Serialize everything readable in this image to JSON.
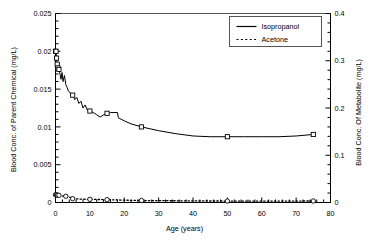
{
  "chart_data": {
    "type": "line",
    "title": "",
    "xlabel": "Age (years)",
    "ylabel": "Blood Conc. of Parent Chemical (mg/L)",
    "ylabel_right": "Blood Conc. Of Metabolite (mg/L)",
    "xlim": [
      0,
      80
    ],
    "ylim": [
      0,
      0.025
    ],
    "ylim_right": [
      0,
      0.4
    ],
    "grid": false,
    "legend_position": "top-right",
    "x_ticks": [
      0,
      10,
      20,
      30,
      40,
      50,
      60,
      70,
      80
    ],
    "x_tick_labels": [
      "0",
      "10",
      "20",
      "30",
      "40",
      "50",
      "60",
      "70",
      "80"
    ],
    "x_minor_step": 2,
    "y_ticks_left": [
      0,
      0.005,
      0.01,
      0.015,
      0.02,
      0.025
    ],
    "y_tick_labels_left": [
      "0",
      "0.005",
      "0.01",
      "0.015",
      "0.02",
      "0.025"
    ],
    "y_minor_step_left": 0.001,
    "y_ticks_right": [
      0,
      0.1,
      0.2,
      0.3,
      0.4
    ],
    "y_tick_labels_right": [
      "0",
      "0.1",
      "0.2",
      "0.3",
      "0.4"
    ],
    "y_minor_step_right": 0.02,
    "series": [
      {
        "name": "Isopropanol",
        "axis": "left",
        "line_style": "solid",
        "marker": "square-open",
        "color": "#000000",
        "points": [
          {
            "x": 0.0,
            "y": 0.02,
            "marker": true
          },
          {
            "x": 0.15,
            "y": 0.02,
            "marker": true
          },
          {
            "x": 0.3,
            "y": 0.0191,
            "marker": true
          },
          {
            "x": 0.5,
            "y": 0.0183,
            "marker": true
          },
          {
            "x": 0.7,
            "y": 0.0178,
            "marker": true
          },
          {
            "x": 1.0,
            "y": 0.0176,
            "marker": true
          },
          {
            "x": 1.3,
            "y": 0.017
          },
          {
            "x": 1.6,
            "y": 0.0163
          },
          {
            "x": 1.9,
            "y": 0.0172
          },
          {
            "x": 2.2,
            "y": 0.016
          },
          {
            "x": 2.6,
            "y": 0.0168
          },
          {
            "x": 3.0,
            "y": 0.0156
          },
          {
            "x": 3.4,
            "y": 0.0152
          },
          {
            "x": 3.8,
            "y": 0.0147
          },
          {
            "x": 4.3,
            "y": 0.0145
          },
          {
            "x": 5.0,
            "y": 0.0142,
            "marker": true
          },
          {
            "x": 5.6,
            "y": 0.0136
          },
          {
            "x": 6.2,
            "y": 0.0139
          },
          {
            "x": 6.8,
            "y": 0.0131
          },
          {
            "x": 7.4,
            "y": 0.0134
          },
          {
            "x": 8.0,
            "y": 0.0125
          },
          {
            "x": 8.6,
            "y": 0.0129
          },
          {
            "x": 9.3,
            "y": 0.0122
          },
          {
            "x": 10.0,
            "y": 0.0121,
            "marker": true
          },
          {
            "x": 11.0,
            "y": 0.0119
          },
          {
            "x": 12.0,
            "y": 0.0116
          },
          {
            "x": 13.0,
            "y": 0.0113
          },
          {
            "x": 14.0,
            "y": 0.0116
          },
          {
            "x": 15.0,
            "y": 0.0118,
            "marker": true
          },
          {
            "x": 16.0,
            "y": 0.0119
          },
          {
            "x": 17.0,
            "y": 0.0119
          },
          {
            "x": 18.0,
            "y": 0.0119
          },
          {
            "x": 18.3,
            "y": 0.0112
          },
          {
            "x": 20.0,
            "y": 0.0108
          },
          {
            "x": 22.0,
            "y": 0.0104
          },
          {
            "x": 25.0,
            "y": 0.01,
            "marker": true
          },
          {
            "x": 30.0,
            "y": 0.0095
          },
          {
            "x": 35.0,
            "y": 0.0091
          },
          {
            "x": 40.0,
            "y": 0.0088
          },
          {
            "x": 45.0,
            "y": 0.0087
          },
          {
            "x": 50.0,
            "y": 0.0087,
            "marker": true
          },
          {
            "x": 55.0,
            "y": 0.0087
          },
          {
            "x": 60.0,
            "y": 0.0087
          },
          {
            "x": 65.0,
            "y": 0.0087
          },
          {
            "x": 70.0,
            "y": 0.0088
          },
          {
            "x": 75.0,
            "y": 0.009,
            "marker": true
          }
        ]
      },
      {
        "name": "Acetone",
        "axis": "right",
        "line_style": "dotted",
        "marker": "circle-open",
        "color": "#000000",
        "points": [
          {
            "x": 0.0,
            "y": 0.0165,
            "marker": true
          },
          {
            "x": 0.3,
            "y": 0.016,
            "marker": true
          },
          {
            "x": 0.6,
            "y": 0.0155,
            "marker": true
          },
          {
            "x": 1.0,
            "y": 0.0152,
            "marker": true
          },
          {
            "x": 1.6,
            "y": 0.0143
          },
          {
            "x": 2.2,
            "y": 0.0136
          },
          {
            "x": 3.0,
            "y": 0.0132,
            "marker": true
          },
          {
            "x": 3.8,
            "y": 0.012
          },
          {
            "x": 4.4,
            "y": 0.0105
          },
          {
            "x": 5.0,
            "y": 0.0081,
            "marker": true
          },
          {
            "x": 6.0,
            "y": 0.0077
          },
          {
            "x": 7.0,
            "y": 0.0073
          },
          {
            "x": 8.0,
            "y": 0.007
          },
          {
            "x": 9.0,
            "y": 0.0068
          },
          {
            "x": 10.0,
            "y": 0.0067,
            "marker": true
          },
          {
            "x": 11.5,
            "y": 0.0065
          },
          {
            "x": 13.0,
            "y": 0.0063
          },
          {
            "x": 15.0,
            "y": 0.006,
            "marker": true
          },
          {
            "x": 17.0,
            "y": 0.0056
          },
          {
            "x": 19.0,
            "y": 0.0052
          },
          {
            "x": 21.0,
            "y": 0.0048
          },
          {
            "x": 23.0,
            "y": 0.0045
          },
          {
            "x": 25.0,
            "y": 0.0042,
            "marker": true
          },
          {
            "x": 28.0,
            "y": 0.004
          },
          {
            "x": 32.0,
            "y": 0.0038
          },
          {
            "x": 36.0,
            "y": 0.0036
          },
          {
            "x": 40.0,
            "y": 0.0034
          },
          {
            "x": 45.0,
            "y": 0.0032
          },
          {
            "x": 50.0,
            "y": 0.0031,
            "marker": true
          },
          {
            "x": 55.0,
            "y": 0.003
          },
          {
            "x": 60.0,
            "y": 0.003
          },
          {
            "x": 65.0,
            "y": 0.003
          },
          {
            "x": 70.0,
            "y": 0.0031
          },
          {
            "x": 75.0,
            "y": 0.0032,
            "marker": true
          }
        ]
      }
    ],
    "legend": [
      {
        "label": "Isopropanol",
        "style": "solid",
        "marker": "none"
      },
      {
        "label": "Acetone",
        "style": "dotted",
        "marker": "none"
      }
    ]
  },
  "colors": {
    "axis": "#000000",
    "line": "#000000",
    "background": "#ffffff",
    "legend_border": "#555555"
  }
}
